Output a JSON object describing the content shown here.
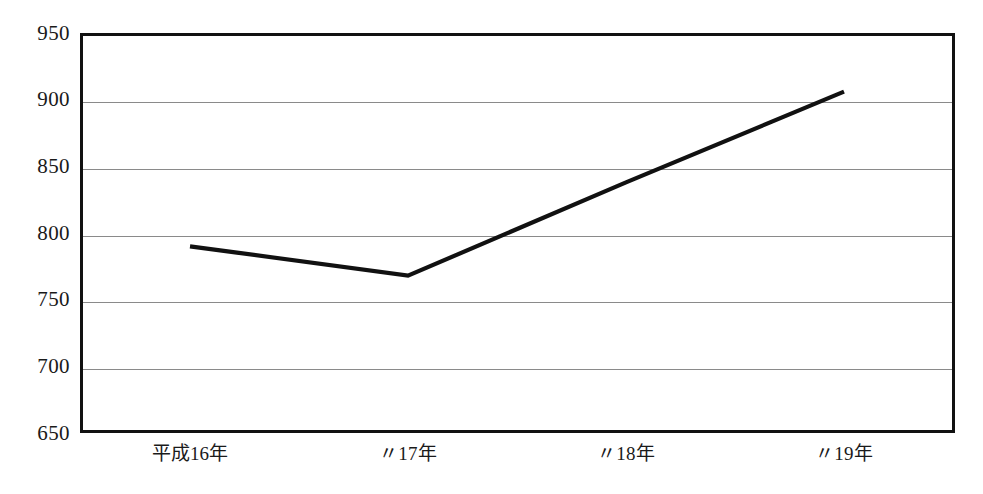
{
  "chart_data": {
    "type": "line",
    "title": "",
    "subtitle": "",
    "xlabel": "",
    "ylabel": "",
    "categories": [
      "平成16年",
      "〃17年",
      "〃18年",
      "〃19年"
    ],
    "series": [
      {
        "name": "",
        "values": [
          790,
          768,
          838,
          906
        ]
      }
    ],
    "ylim": [
      650,
      950
    ],
    "ytick_values": [
      650,
      700,
      750,
      800,
      850,
      900,
      950
    ],
    "ytick_labels": [
      "650",
      "700",
      "750",
      "800",
      "850",
      "900",
      "950"
    ],
    "xtick_labels": [
      "平成16年",
      "〃17年",
      "〃18年",
      "〃19年"
    ],
    "grid": true,
    "grid_axis": "y",
    "legend": false,
    "legend_position": "none",
    "annotations": [],
    "colors": {
      "line": "#111111",
      "frame": "#111111",
      "gridline": "#8a8a8a",
      "background": "#ffffff",
      "text": "#1a1a1a"
    }
  }
}
